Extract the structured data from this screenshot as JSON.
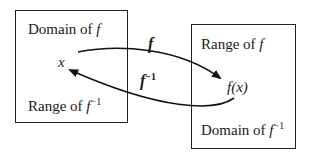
{
  "diagram": {
    "left_box": {
      "top_label_text": "Domain of ",
      "top_label_var": "f",
      "point": "x",
      "bottom_label_text": "Range of ",
      "bottom_label_var": "f",
      "bottom_label_sup": "−1"
    },
    "right_box": {
      "top_label_text": "Range of ",
      "top_label_var": "f",
      "point": "f(x)",
      "bottom_label_text": "Domain of ",
      "bottom_label_var": "f",
      "bottom_label_sup": "−1"
    },
    "arrows": {
      "forward_label": "f",
      "inverse_label_var": "f",
      "inverse_label_sup": "−1"
    },
    "colors": {
      "line": "#222222",
      "background": "#ffffff"
    }
  }
}
